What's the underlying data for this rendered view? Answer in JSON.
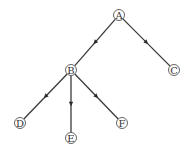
{
  "diagram": {
    "type": "tree",
    "nodes": [
      {
        "id": "A",
        "label": "A",
        "x": 119,
        "y": 15
      },
      {
        "id": "B",
        "label": "B",
        "x": 71,
        "y": 70
      },
      {
        "id": "C",
        "label": "C",
        "x": 174,
        "y": 70
      },
      {
        "id": "D",
        "label": "D",
        "x": 20,
        "y": 123
      },
      {
        "id": "E",
        "label": "E",
        "x": 71,
        "y": 138
      },
      {
        "id": "F",
        "label": "F",
        "x": 122,
        "y": 123
      }
    ],
    "edges": [
      {
        "from": "A",
        "to": "B"
      },
      {
        "from": "A",
        "to": "C"
      },
      {
        "from": "B",
        "to": "D"
      },
      {
        "from": "B",
        "to": "E"
      },
      {
        "from": "B",
        "to": "F"
      }
    ],
    "style": {
      "edge_color": "#3a3a3a",
      "arrow_color": "#2a2a2a",
      "node_stroke": "#555555",
      "node_fill": "#ffffff",
      "label_color": "#333333",
      "node_radius": 5.5
    }
  }
}
